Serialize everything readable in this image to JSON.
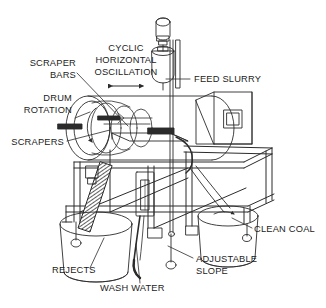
{
  "diagram": {
    "type": "technical-line-drawing",
    "background_color": "#ffffff",
    "line_color": "#2b2b2b",
    "text_color": "#1b1b1b"
  },
  "labels": {
    "cyclic_horizontal_oscillation": {
      "lines": [
        "CYCLIC",
        "HORIZONTAL",
        "OSCILLATION"
      ],
      "line1": "CYCLIC",
      "line2": "HORIZONTAL",
      "line3": "OSCILLATION",
      "align": "center",
      "points_to": "oscillation-arrow"
    },
    "scraper_bars": {
      "lines": [
        "SCRAPER",
        "BARS"
      ],
      "line1": "SCRAPER",
      "line2": "BARS",
      "align": "right",
      "points_to": "drum-interior-bars"
    },
    "drum_rotation": {
      "lines": [
        "DRUM",
        "ROTATION"
      ],
      "line1": "DRUM",
      "line2": "ROTATION",
      "align": "right",
      "points_to": "drum-rotation-arrow"
    },
    "scrapers": {
      "line1": "SCRAPERS",
      "align": "right",
      "points_to": "scraper-blade"
    },
    "feed_slurry": {
      "line1": "FEED SLURRY",
      "align": "left",
      "points_to": "feed-tank"
    },
    "clean_coal": {
      "line1": "CLEAN COAL",
      "align": "left",
      "points_to": "clean-coal-bucket"
    },
    "adjustable_slope": {
      "lines": [
        "ADJUSTABLE",
        "SLOPE"
      ],
      "line1": "ADJUSTABLE",
      "line2": "SLOPE",
      "align": "left",
      "points_to": "slope-adjuster-foot"
    },
    "rejects": {
      "line1": "REJECTS",
      "align": "left",
      "points_to": "rejects-bucket"
    },
    "wash_water": {
      "line1": "WASH WATER",
      "align": "center",
      "points_to": "wash-water-hose"
    }
  },
  "components": {
    "drive_motor": "drive-motor",
    "feed_tank": "feed-tank",
    "drum": "rotating-drum",
    "drum_spiral": "drum-internal-spiral",
    "gearbox_housing": "gearbox-housing",
    "access_panel": "access-panel",
    "support_frame": "support-frame",
    "rejects_bucket": "rejects-bucket",
    "clean_coal_bucket": "clean-coal-bucket",
    "reject_chute": "reject-chute",
    "wash_water_hose": "wash-water-hose",
    "sight_glass": "sight-glass",
    "slope_adjuster": "slope-adjuster"
  }
}
